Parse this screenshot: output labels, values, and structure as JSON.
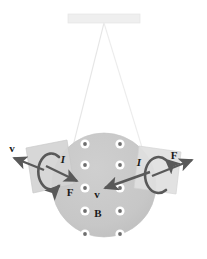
{
  "figure": {
    "background_color": "#ffffff"
  },
  "colors": {
    "support_bar": "#efefef",
    "support_bar_stroke": "#e2e2e2",
    "string": "#e8e8e8",
    "disc_fill": "#c8c8c8",
    "disc_stroke": "#c0c0c0",
    "loop_fill": "#d6d6d6",
    "loop_fill_right": "#e3e3e3",
    "loop_stroke": "#c2c2c2",
    "arrow_dark": "#595959",
    "dot_ring": "#ffffff",
    "dot_core": "#6e6e6e",
    "label_text": "#1a1a1a"
  },
  "support": {
    "name": "ceiling-support-bar",
    "x": 68,
    "y": 14,
    "width": 72,
    "height": 9
  },
  "strings": [
    {
      "name": "suspension-string-left",
      "x1": 104,
      "y1": 23,
      "x2": 72,
      "y2": 148
    },
    {
      "name": "suspension-string-right",
      "x1": 104,
      "y1": 23,
      "x2": 143,
      "y2": 152
    }
  ],
  "disc": {
    "name": "magnetic-field-disc",
    "cx": 104,
    "cy": 185,
    "r": 52
  },
  "field_dots": {
    "symbol": "field-out-of-page-dot",
    "meaning": "B field out of page",
    "columns_x": [
      85,
      120
    ],
    "rows_y": [
      144,
      165,
      188,
      211,
      234
    ],
    "outer_radius": 4.6,
    "inner_radius": 1.9,
    "count": 10
  },
  "loops": [
    {
      "name": "current-loop-left",
      "polygon": "26,148 67,140 73,183 33,192",
      "rotation_arrow": "counter-clockwise-current-arrow-left"
    },
    {
      "name": "current-loop-right",
      "polygon": "139,147 180,152 175,193 134,188",
      "rotation_arrow": "clockwise-current-arrow-right"
    }
  ],
  "labels": [
    {
      "id": "v-left",
      "text": "v",
      "x": 14,
      "y": 153,
      "kind": "vector"
    },
    {
      "id": "I-left",
      "text": "I",
      "x": 62,
      "y": 162,
      "kind": "current"
    },
    {
      "id": "F-left",
      "text": "F",
      "x": 69,
      "y": 193,
      "kind": "vector"
    },
    {
      "id": "I-right",
      "text": "I",
      "x": 139,
      "y": 164,
      "kind": "current"
    },
    {
      "id": "F-right",
      "text": "F",
      "x": 172,
      "y": 158,
      "kind": "vector"
    },
    {
      "id": "v-right",
      "text": "v",
      "x": 96,
      "y": 196,
      "kind": "vector"
    },
    {
      "id": "B-field",
      "text": "B",
      "x": 97,
      "y": 215,
      "kind": "vector"
    }
  ],
  "force_arrows": [
    {
      "name": "velocity-arrow-left",
      "x1": 42,
      "y1": 170,
      "x2": 12,
      "y2": 158
    },
    {
      "name": "force-arrow-left",
      "x1": 45,
      "y1": 167,
      "x2": 76,
      "y2": 181
    },
    {
      "name": "force-arrow-right",
      "x1": 152,
      "y1": 175,
      "x2": 190,
      "y2": 161
    },
    {
      "name": "velocity-arrow-right",
      "x1": 148,
      "y1": 172,
      "x2": 104,
      "y2": 188
    }
  ],
  "arc_arrows": [
    {
      "name": "current-rotation-arc-left",
      "direction": "counter-clockwise"
    },
    {
      "name": "current-rotation-arc-right",
      "direction": "clockwise"
    }
  ]
}
